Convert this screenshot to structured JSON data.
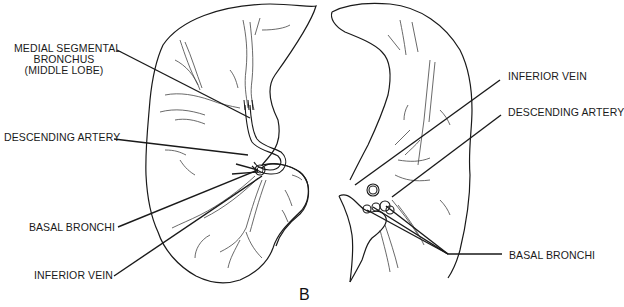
{
  "figure": {
    "panel_letter": "B",
    "left_lung": {
      "labels": {
        "medial_segmental_line1": "MEDIAL SEGMENTAL",
        "medial_segmental_line2": "BRONCHUS",
        "medial_segmental_line3": "(MIDDLE LOBE)",
        "descending_artery": "DESCENDING ARTERY",
        "basal_bronchi": "BASAL BRONCHI",
        "inferior_vein": "INFERIOR VEIN"
      }
    },
    "right_lung": {
      "labels": {
        "inferior_vein": "INFERIOR VEIN",
        "descending_artery": "DESCENDING ARTERY",
        "basal_bronchi": "BASAL BRONCHI"
      }
    },
    "colors": {
      "line": "#1a1a1a",
      "background": "#ffffff",
      "vessel": "#444444"
    }
  }
}
